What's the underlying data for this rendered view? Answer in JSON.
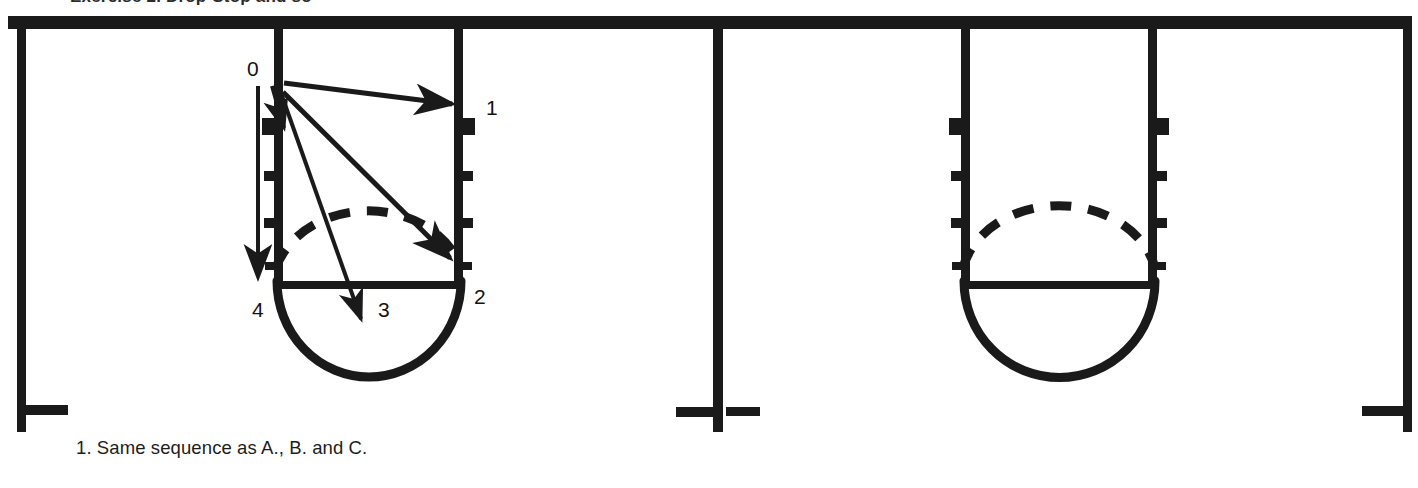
{
  "figure": {
    "clipped_heading": "Exercise 2. Drop-Stop and so",
    "caption": "1. Same sequence as A., B. and C.",
    "ink_color": "#1a1a1a",
    "background_color": "#ffffff"
  },
  "panels": [
    {
      "id": "panel-left",
      "labeled": true,
      "sequence_labels": [
        {
          "id": "pos-0",
          "text": "0",
          "x": 247,
          "y": 60
        },
        {
          "id": "pos-1",
          "text": "1",
          "x": 486,
          "y": 99
        },
        {
          "id": "pos-2",
          "text": "2",
          "x": 474,
          "y": 288
        },
        {
          "id": "pos-3",
          "text": "3",
          "x": 378,
          "y": 300
        },
        {
          "id": "pos-4",
          "text": "4",
          "x": 252,
          "y": 300
        }
      ],
      "pivot": {
        "x": 282,
        "y": 90
      },
      "arrows": [
        {
          "id": "arrow-to-1",
          "to_x": 455,
          "to_y": 104
        },
        {
          "id": "arrow-to-2",
          "to_x": 452,
          "to_y": 262
        },
        {
          "id": "arrow-to-3",
          "to_x": 360,
          "to_y": 322
        },
        {
          "id": "arrow-to-4",
          "to_x": 282,
          "to_y": 232
        }
      ],
      "vertical_arrow": {
        "id": "drop-direction-arrow",
        "x": 258,
        "y_top": 86,
        "y_bottom": 282
      },
      "posts": [
        {
          "id": "post-left",
          "x": 278
        },
        {
          "id": "post-right",
          "x": 458
        }
      ],
      "tick_rows_y": [
        124,
        176,
        223
      ],
      "bar_y": 285,
      "bowl_bottom_y": 380,
      "dashed_arc_peak_y": 203
    },
    {
      "id": "panel-right",
      "labeled": false,
      "sequence_labels": [],
      "posts": [
        {
          "id": "post-left",
          "x": 965
        },
        {
          "id": "post-right",
          "x": 1152
        }
      ],
      "tick_rows_y": [
        124,
        176,
        223
      ],
      "bar_y": 285,
      "bowl_bottom_y": 380,
      "dashed_arc_peak_y": 203
    }
  ],
  "frame": {
    "top_rail": {
      "y": 22,
      "x_start": 8,
      "x_end": 1412,
      "thickness": 13
    },
    "outer_posts": [
      {
        "id": "frame-post-far-left",
        "x": 22,
        "foot_direction": "right"
      },
      {
        "id": "frame-post-middle",
        "x": 718,
        "foot_direction": "both"
      },
      {
        "id": "frame-post-far-right",
        "x": 1408,
        "foot_direction": "left"
      }
    ],
    "post_bottom_y": 432,
    "foot_y": 410
  }
}
